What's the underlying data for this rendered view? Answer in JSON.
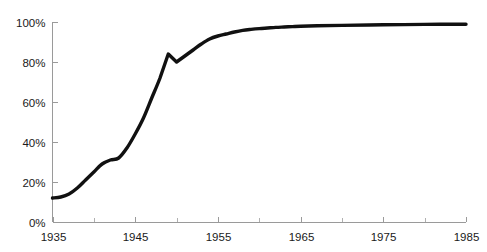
{
  "chart_data": {
    "type": "line",
    "title": "",
    "subtitle": "",
    "xlabel": "",
    "ylabel": "",
    "xlim": [
      1935,
      1985
    ],
    "ylim": [
      0,
      100
    ],
    "grid": false,
    "legend": false,
    "legend_position": "none",
    "line_color": "#111111",
    "axis_color": "#9a9a9a",
    "background_color": "#ffffff",
    "y_ticks": [
      0,
      20,
      40,
      60,
      80,
      100
    ],
    "y_tick_labels": [
      "0%",
      "20%",
      "40%",
      "60%",
      "80%",
      "100%"
    ],
    "x_ticks": [
      1935,
      1945,
      1955,
      1965,
      1975,
      1985
    ],
    "x_tick_labels": [
      "1935",
      "1945",
      "1955",
      "1965",
      "1975",
      "1985"
    ],
    "x_minor_ticks": [
      1940,
      1950,
      1960,
      1970,
      1980
    ],
    "series": [
      {
        "name": "coverage",
        "x": [
          1935,
          1936,
          1937,
          1938,
          1939,
          1940,
          1941,
          1942,
          1943,
          1944,
          1945,
          1946,
          1947,
          1948,
          1949,
          1950,
          1951,
          1952,
          1953,
          1954,
          1955,
          1956,
          1957,
          1958,
          1959,
          1960,
          1961,
          1962,
          1963,
          1964,
          1965,
          1967,
          1970,
          1975,
          1980,
          1985
        ],
        "values": [
          12,
          12.5,
          14,
          17,
          21,
          25,
          29,
          31,
          32,
          37,
          44,
          52,
          62,
          72,
          84,
          80,
          83,
          86,
          89,
          91.5,
          93,
          94,
          95,
          95.8,
          96.3,
          96.7,
          97,
          97.3,
          97.5,
          97.7,
          97.9,
          98.1,
          98.3,
          98.6,
          98.8,
          98.9
        ]
      }
    ]
  }
}
